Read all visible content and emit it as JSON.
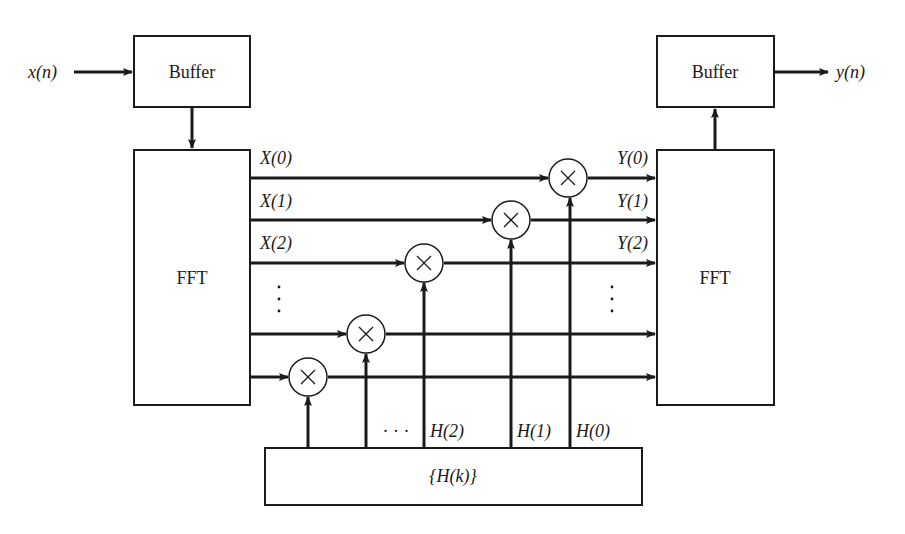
{
  "diagram": {
    "input_label": "x(n)",
    "output_label": "y(n)",
    "blocks": {
      "input_buffer": "Buffer",
      "output_buffer": "Buffer",
      "forward_fft": "FFT",
      "inverse_fft": "FFT",
      "filter_coeffs": "{H(k)}"
    },
    "fft_outputs": [
      "X(0)",
      "X(1)",
      "X(2)"
    ],
    "ifft_inputs": [
      "Y(0)",
      "Y(1)",
      "Y(2)"
    ],
    "coeff_labels": [
      "H(2)",
      "H(1)",
      "H(0)"
    ],
    "ellipsis_vertical": "⋮",
    "ellipsis_horizontal": "· · ·",
    "multiplier_symbol": "×",
    "colors": {
      "stroke": "#1a1a1a",
      "background": "#ffffff"
    }
  }
}
